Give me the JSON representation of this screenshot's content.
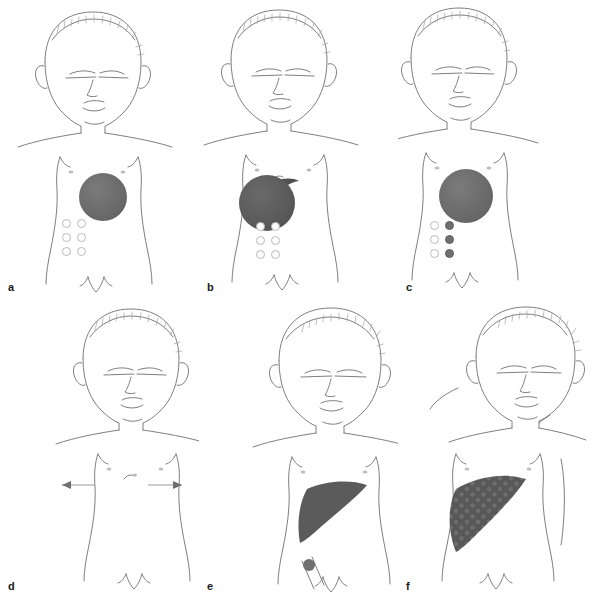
{
  "figure": {
    "title": "",
    "panel_count": 6,
    "panels": [
      {
        "id": "a",
        "label": "a",
        "description": "Infant head and torso outline with localized primary tumor and negative bone marrow",
        "elements": {
          "head_outline": "infant-head-front-view",
          "torso_outline": "infant-torso-front-view",
          "primary_tumor": {
            "shape": "circle",
            "fill": "#6f6f6f",
            "cx": 103,
            "cy": 197,
            "r": 24
          },
          "liver": null,
          "marrow_grid": {
            "columns": 2,
            "rows": 3,
            "states": [
              [
                "open",
                "open"
              ],
              [
                "open",
                "open"
              ],
              [
                "open",
                "open"
              ]
            ]
          },
          "metastases": []
        }
      },
      {
        "id": "b",
        "label": "b",
        "description": "Larger primary tumor with adjacent nodal/extension lesion, negative bone marrow",
        "elements": {
          "primary_tumor": {
            "shape": "circle",
            "fill": "#5c5c5c",
            "cx": 267,
            "cy": 202,
            "r": 28
          },
          "adjacent_lesion": {
            "shape": "crescent",
            "fill": "#4f4f4f"
          },
          "marrow_grid": {
            "columns": 2,
            "rows": 3,
            "states": [
              [
                "open",
                "open"
              ],
              [
                "open",
                "open"
              ],
              [
                "open",
                "open"
              ]
            ]
          },
          "metastases": []
        }
      },
      {
        "id": "c",
        "label": "c",
        "description": "Primary tumor with partially positive bone marrow (right column filled)",
        "elements": {
          "primary_tumor": {
            "shape": "circle",
            "fill": "#6f6f6f",
            "cx": 466,
            "cy": 196,
            "r": 27
          },
          "marrow_grid": {
            "columns": 2,
            "rows": 3,
            "states": [
              [
                "open",
                "filled"
              ],
              [
                "open",
                "filled"
              ],
              [
                "open",
                "filled"
              ]
            ]
          },
          "metastases": []
        }
      },
      {
        "id": "d",
        "label": "d",
        "description": "Central tumor with bone marrow involvement; arrows indicate alternative equivalent presentations on either side",
        "elements": {
          "primary_tumor": {
            "shape": "circle",
            "fill": "#6f6f6f",
            "cx": 97,
            "cy": 486,
            "r": 26
          },
          "marrow_grid": {
            "columns": 2,
            "rows": 3,
            "states": [
              [
                "filled",
                "filled"
              ],
              [
                "filled",
                "filled"
              ],
              [
                "filled",
                "filled"
              ]
            ]
          },
          "left_alt_tumor": {
            "shape": "circle",
            "fill": "#6f6f6f",
            "cx": 26,
            "cy": 482,
            "r": 21
          },
          "left_alt_grid_filled": {
            "columns": 2,
            "rows": 3,
            "state": "filled"
          },
          "left_alt_grid_open": {
            "columns": 2,
            "rows": 3,
            "state": "open"
          },
          "right_alt_tumor": {
            "shape": "circle",
            "fill": "#6f6f6f",
            "cx": 172,
            "cy": 481,
            "r": 19
          },
          "right_alt_grid_filled": {
            "columns": 2,
            "rows": 3,
            "state": "filled"
          },
          "arrows": [
            {
              "direction": "left",
              "connector_label": "or"
            },
            {
              "direction": "right",
              "connector_label": "or"
            }
          ],
          "inline_or_label": "or"
        }
      },
      {
        "id": "e",
        "label": "e",
        "description": "Disseminated disease: skull lesion, solid liver involvement, primary tumor, positive marrow and bone lesion",
        "elements": {
          "skull_lesion": {
            "shape": "circle",
            "fill": "#6f6f6f",
            "cx": 315,
            "cy": 322,
            "r": 12
          },
          "liver": {
            "shape": "wedge",
            "fill": "#5b5b5b",
            "texture": "solid"
          },
          "primary_tumor": {
            "shape": "circle",
            "fill": "#6f6f6f",
            "cx": 358,
            "cy": 496,
            "r": 26
          },
          "marrow_grid": {
            "columns": 2,
            "rows": 3,
            "states": [
              [
                "filled",
                "filled"
              ],
              [
                "filled",
                "filled"
              ],
              [
                "filled",
                "filled"
              ]
            ]
          },
          "bone_lesion": {
            "shape": "circle",
            "fill": "#6f6f6f",
            "cx": 309,
            "cy": 565,
            "r": 6
          },
          "left_reference_tumor": {
            "shape": "circle",
            "fill": "#6f6f6f",
            "cx": 231,
            "cy": 477,
            "r": 20
          },
          "left_reference_grid": {
            "columns": 2,
            "rows": 3,
            "state": "filled"
          }
        }
      },
      {
        "id": "f",
        "label": "f",
        "description": "Widespread metastatic disease: skin/subcutaneous nodules, mottled liver infiltration, primary tumor",
        "elements": {
          "liver": {
            "shape": "wedge",
            "fill": "#5b5b5b",
            "texture": "mottled-dots"
          },
          "primary_tumor": {
            "shape": "circle",
            "fill": "#6f6f6f",
            "cx": 525,
            "cy": 500,
            "r": 26
          },
          "nodules": [
            {
              "location": "cheek-jaw",
              "cx": 537,
              "cy": 394,
              "r": 7
            },
            {
              "location": "shoulder-left",
              "cx": 458,
              "cy": 427,
              "r": 7
            },
            {
              "location": "chest-right-upper",
              "cx": 561,
              "cy": 459,
              "r": 7
            },
            {
              "location": "flank-right-lower",
              "cx": 563,
              "cy": 531,
              "r": 7
            },
            {
              "location": "groin",
              "cx": 534,
              "cy": 586,
              "r": 7
            }
          ]
        }
      }
    ]
  },
  "legend": {
    "tumor_color": "#6f6f6f",
    "liver_color": "#5b5b5b",
    "marrow_open_color": "#ffffff",
    "marrow_filled_color": "#6f6f6f",
    "outline_color": "#6b6b6b",
    "background": "#ffffff"
  },
  "labels": {
    "or": "or",
    "panel_a": "a",
    "panel_b": "b",
    "panel_c": "c",
    "panel_d": "d",
    "panel_e": "e",
    "panel_f": "f"
  }
}
